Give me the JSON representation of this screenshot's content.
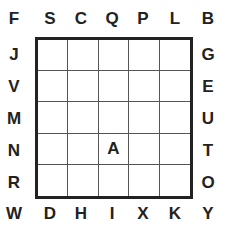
{
  "corners": {
    "top_left": "F",
    "top_right": "B",
    "bottom_left": "W",
    "bottom_right": "Y"
  },
  "top": [
    "S",
    "C",
    "Q",
    "P",
    "L"
  ],
  "bottom": [
    "D",
    "H",
    "I",
    "X",
    "K"
  ],
  "left": [
    "J",
    "V",
    "M",
    "N",
    "R"
  ],
  "right": [
    "G",
    "E",
    "U",
    "T",
    "O"
  ],
  "grid": [
    [
      "",
      "",
      "",
      "",
      ""
    ],
    [
      "",
      "",
      "",
      "",
      ""
    ],
    [
      "",
      "",
      "",
      "",
      ""
    ],
    [
      "",
      "",
      "A",
      "",
      ""
    ],
    [
      "",
      "",
      "",
      "",
      ""
    ]
  ]
}
